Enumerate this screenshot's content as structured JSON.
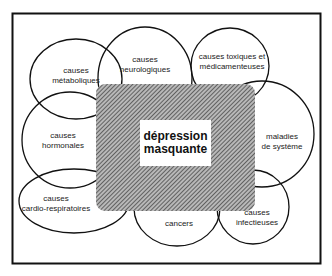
{
  "diagram": {
    "title": "dépression masquante",
    "center": {
      "line1": "dépression",
      "line2": "masquante",
      "fill_pattern": "diagonal-hatch",
      "fill_color": "#8a8a8a"
    },
    "causes": [
      {
        "id": "metaboliques",
        "line1": "causes",
        "line2": "métaboliques",
        "cx": 76,
        "cy": 79,
        "rx": 46,
        "ry": 40
      },
      {
        "id": "neurologiques",
        "line1": "causes",
        "line2": "neurologiques",
        "cx": 145,
        "cy": 78,
        "rx": 47,
        "ry": 51
      },
      {
        "id": "toxiques",
        "line1": "causes toxiques et",
        "line2": "médicamenteuses",
        "cx": 230,
        "cy": 66,
        "rx": 39,
        "ry": 38
      },
      {
        "id": "hormonales",
        "line1": "causes",
        "line2": "hormonales",
        "cx": 70,
        "cy": 140,
        "rx": 48,
        "ry": 48
      },
      {
        "id": "systeme",
        "line1": "maladies",
        "line2": "de système",
        "cx": 262,
        "cy": 134,
        "rx": 52,
        "ry": 53
      },
      {
        "id": "cardio",
        "line1": "causes",
        "line2": "cardio-respiratoires",
        "cx": 74,
        "cy": 201,
        "rx": 55,
        "ry": 32
      },
      {
        "id": "cancers",
        "line1": "cancers",
        "line2": "",
        "cx": 177,
        "cy": 208,
        "rx": 43,
        "ry": 38
      },
      {
        "id": "infectieuses",
        "line1": "causes",
        "line2": "infectieuses",
        "cx": 253,
        "cy": 207,
        "rx": 36,
        "ry": 37
      }
    ],
    "colors": {
      "stroke": "#111111",
      "background": "#ffffff"
    }
  }
}
